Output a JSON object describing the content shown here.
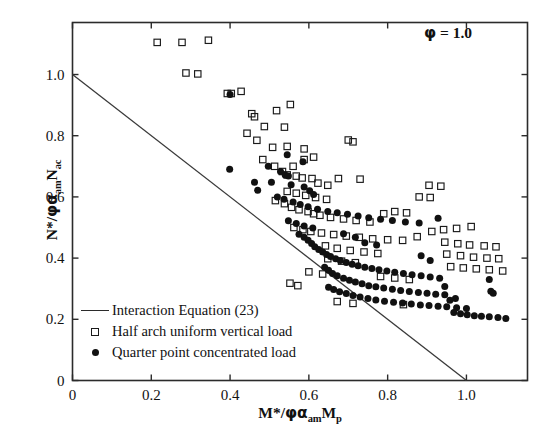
{
  "chart_data": {
    "type": "scatter",
    "title": "",
    "xlabel": "M*/φαamMp",
    "ylabel": "N*/φαamNac",
    "xlim": [
      0,
      1.155
    ],
    "ylim": [
      0,
      1.17
    ],
    "xticks": [
      0,
      0.2,
      0.4,
      0.6,
      0.8,
      1.0
    ],
    "yticks": [
      0,
      0.2,
      0.4,
      0.6,
      0.8,
      1.0
    ],
    "xticklabels": [
      "0",
      "0.2",
      "0.4",
      "0.6",
      "0.8",
      "1.0"
    ],
    "yticklabels": [
      "0",
      "0.2",
      "0.4",
      "0.6",
      "0.8",
      "1.0"
    ],
    "grid": false,
    "annotation": "φ = 1.0",
    "legend_position": "lower-left",
    "legend": [
      {
        "label": "Interaction Equation (23)",
        "marker": "line"
      },
      {
        "label": "Half arch uniform vertical load",
        "marker": "open-square"
      },
      {
        "label": "Quarter point concentrated load",
        "marker": "filled-circle"
      }
    ],
    "series": [
      {
        "name": "Interaction Equation (23)",
        "type": "line",
        "points": [
          [
            0,
            1.0
          ],
          [
            1.0,
            0
          ]
        ]
      },
      {
        "name": "Half arch uniform vertical load",
        "type": "scatter",
        "marker": "open-square",
        "points": [
          [
            0.215,
            1.105
          ],
          [
            0.278,
            1.105
          ],
          [
            0.345,
            1.112
          ],
          [
            0.288,
            1.005
          ],
          [
            0.318,
            1.002
          ],
          [
            0.393,
            0.938
          ],
          [
            0.403,
            0.938
          ],
          [
            0.428,
            0.945
          ],
          [
            0.455,
            0.872
          ],
          [
            0.462,
            0.862
          ],
          [
            0.518,
            0.882
          ],
          [
            0.443,
            0.808
          ],
          [
            0.487,
            0.83
          ],
          [
            0.538,
            0.828
          ],
          [
            0.468,
            0.785
          ],
          [
            0.553,
            0.902
          ],
          [
            0.508,
            0.762
          ],
          [
            0.545,
            0.765
          ],
          [
            0.588,
            0.757
          ],
          [
            0.483,
            0.722
          ],
          [
            0.588,
            0.722
          ],
          [
            0.612,
            0.73
          ],
          [
            0.513,
            0.7
          ],
          [
            0.56,
            0.7
          ],
          [
            0.533,
            0.683
          ],
          [
            0.545,
            0.672
          ],
          [
            0.568,
            0.668
          ],
          [
            0.583,
            0.662
          ],
          [
            0.608,
            0.66
          ],
          [
            0.7,
            0.786
          ],
          [
            0.712,
            0.78
          ],
          [
            0.623,
            0.645
          ],
          [
            0.648,
            0.638
          ],
          [
            0.545,
            0.618
          ],
          [
            0.568,
            0.612
          ],
          [
            0.592,
            0.605
          ],
          [
            0.617,
            0.598
          ],
          [
            0.645,
            0.592
          ],
          [
            0.675,
            0.66
          ],
          [
            0.73,
            0.658
          ],
          [
            0.515,
            0.588
          ],
          [
            0.538,
            0.578
          ],
          [
            0.556,
            0.566
          ],
          [
            0.575,
            0.558
          ],
          [
            0.598,
            0.552
          ],
          [
            0.612,
            0.545
          ],
          [
            0.628,
            0.54
          ],
          [
            0.655,
            0.533
          ],
          [
            0.688,
            0.528
          ],
          [
            0.72,
            0.523
          ],
          [
            0.755,
            0.518
          ],
          [
            0.79,
            0.545
          ],
          [
            0.818,
            0.552
          ],
          [
            0.848,
            0.548
          ],
          [
            0.88,
            0.6
          ],
          [
            0.908,
            0.598
          ],
          [
            0.905,
            0.638
          ],
          [
            0.935,
            0.635
          ],
          [
            0.562,
            0.5
          ],
          [
            0.585,
            0.493
          ],
          [
            0.605,
            0.487
          ],
          [
            0.632,
            0.482
          ],
          [
            0.663,
            0.477
          ],
          [
            0.695,
            0.472
          ],
          [
            0.728,
            0.468
          ],
          [
            0.762,
            0.463
          ],
          [
            0.8,
            0.46
          ],
          [
            0.838,
            0.458
          ],
          [
            0.875,
            0.47
          ],
          [
            0.912,
            0.487
          ],
          [
            0.942,
            0.493
          ],
          [
            0.975,
            0.497
          ],
          [
            1.012,
            0.503
          ],
          [
            0.945,
            0.452
          ],
          [
            0.978,
            0.447
          ],
          [
            1.008,
            0.443
          ],
          [
            1.045,
            0.44
          ],
          [
            1.075,
            0.437
          ],
          [
            0.95,
            0.413
          ],
          [
            0.985,
            0.408
          ],
          [
            1.018,
            0.403
          ],
          [
            1.052,
            0.4
          ],
          [
            1.082,
            0.398
          ],
          [
            0.96,
            0.372
          ],
          [
            0.992,
            0.368
          ],
          [
            1.025,
            0.365
          ],
          [
            1.058,
            0.362
          ],
          [
            1.092,
            0.358
          ],
          [
            0.642,
            0.44
          ],
          [
            0.672,
            0.432
          ],
          [
            0.705,
            0.425
          ],
          [
            0.74,
            0.42
          ],
          [
            0.775,
            0.415
          ],
          [
            0.648,
            0.398
          ],
          [
            0.683,
            0.39
          ],
          [
            0.718,
            0.385
          ],
          [
            0.6,
            0.355
          ],
          [
            0.635,
            0.348
          ],
          [
            0.552,
            0.318
          ],
          [
            0.572,
            0.31
          ],
          [
            0.782,
            0.34
          ],
          [
            0.818,
            0.335
          ],
          [
            0.855,
            0.33
          ],
          [
            0.672,
            0.258
          ],
          [
            0.712,
            0.252
          ],
          [
            0.84,
            0.248
          ]
        ]
      },
      {
        "name": "Quarter point concentrated load",
        "type": "scatter",
        "marker": "filled-circle",
        "points": [
          [
            0.4,
            0.935
          ],
          [
            0.399,
            0.69
          ],
          [
            0.545,
            0.738
          ],
          [
            0.585,
            0.715
          ],
          [
            0.497,
            0.7
          ],
          [
            0.528,
            0.683
          ],
          [
            0.54,
            0.672
          ],
          [
            0.548,
            0.668
          ],
          [
            0.505,
            0.648
          ],
          [
            0.555,
            0.64
          ],
          [
            0.588,
            0.632
          ],
          [
            0.602,
            0.62
          ],
          [
            0.612,
            0.608
          ],
          [
            0.52,
            0.6
          ],
          [
            0.537,
            0.592
          ],
          [
            0.56,
            0.583
          ],
          [
            0.578,
            0.575
          ],
          [
            0.598,
            0.568
          ],
          [
            0.622,
            0.56
          ],
          [
            0.648,
            0.552
          ],
          [
            0.672,
            0.548
          ],
          [
            0.698,
            0.543
          ],
          [
            0.725,
            0.538
          ],
          [
            0.752,
            0.532
          ],
          [
            0.782,
            0.527
          ],
          [
            0.812,
            0.523
          ],
          [
            0.845,
            0.518
          ],
          [
            0.88,
            0.515
          ],
          [
            0.928,
            0.53
          ],
          [
            0.548,
            0.522
          ],
          [
            0.568,
            0.513
          ],
          [
            0.588,
            0.505
          ],
          [
            0.61,
            0.498
          ],
          [
            0.575,
            0.478
          ],
          [
            0.588,
            0.468
          ],
          [
            0.598,
            0.458
          ],
          [
            0.607,
            0.448
          ],
          [
            0.615,
            0.437
          ],
          [
            0.625,
            0.428
          ],
          [
            0.635,
            0.42
          ],
          [
            0.645,
            0.412
          ],
          [
            0.655,
            0.405
          ],
          [
            0.668,
            0.398
          ],
          [
            0.68,
            0.392
          ],
          [
            0.695,
            0.386
          ],
          [
            0.71,
            0.38
          ],
          [
            0.725,
            0.375
          ],
          [
            0.742,
            0.37
          ],
          [
            0.76,
            0.366
          ],
          [
            0.778,
            0.362
          ],
          [
            0.798,
            0.358
          ],
          [
            0.818,
            0.354
          ],
          [
            0.84,
            0.35
          ],
          [
            0.862,
            0.346
          ],
          [
            0.885,
            0.342
          ],
          [
            0.908,
            0.338
          ],
          [
            0.932,
            0.334
          ],
          [
            0.64,
            0.37
          ],
          [
            0.65,
            0.36
          ],
          [
            0.66,
            0.35
          ],
          [
            0.672,
            0.342
          ],
          [
            0.688,
            0.334
          ],
          [
            0.703,
            0.328
          ],
          [
            0.718,
            0.322
          ],
          [
            0.735,
            0.316
          ],
          [
            0.752,
            0.31
          ],
          [
            0.77,
            0.306
          ],
          [
            0.79,
            0.302
          ],
          [
            0.812,
            0.298
          ],
          [
            0.833,
            0.294
          ],
          [
            0.855,
            0.291
          ],
          [
            0.878,
            0.288
          ],
          [
            0.9,
            0.285
          ],
          [
            0.922,
            0.282
          ],
          [
            0.945,
            0.28
          ],
          [
            0.65,
            0.305
          ],
          [
            0.663,
            0.297
          ],
          [
            0.678,
            0.29
          ],
          [
            0.695,
            0.284
          ],
          [
            0.712,
            0.278
          ],
          [
            0.73,
            0.273
          ],
          [
            0.75,
            0.268
          ],
          [
            0.77,
            0.263
          ],
          [
            0.792,
            0.259
          ],
          [
            0.815,
            0.256
          ],
          [
            0.838,
            0.253
          ],
          [
            0.86,
            0.25
          ],
          [
            0.883,
            0.247
          ],
          [
            0.905,
            0.245
          ],
          [
            0.928,
            0.243
          ],
          [
            0.95,
            0.241
          ],
          [
            0.975,
            0.238
          ],
          [
            1.0,
            0.235
          ],
          [
            0.968,
            0.222
          ],
          [
            0.985,
            0.218
          ],
          [
            1.002,
            0.215
          ],
          [
            1.02,
            0.212
          ],
          [
            1.038,
            0.21
          ],
          [
            1.058,
            0.208
          ],
          [
            1.08,
            0.206
          ],
          [
            1.1,
            0.203
          ],
          [
            0.958,
            0.262
          ],
          [
            0.972,
            0.268
          ],
          [
            1.058,
            0.33
          ],
          [
            1.062,
            0.292
          ],
          [
            1.068,
            0.285
          ],
          [
            0.945,
            0.307
          ],
          [
            0.908,
            0.392
          ],
          [
            0.885,
            0.408
          ],
          [
            0.742,
            0.45
          ],
          [
            0.772,
            0.443
          ],
          [
            0.718,
            0.468
          ],
          [
            0.688,
            0.48
          ],
          [
            0.47,
            0.622
          ],
          [
            0.462,
            0.648
          ]
        ]
      }
    ]
  }
}
